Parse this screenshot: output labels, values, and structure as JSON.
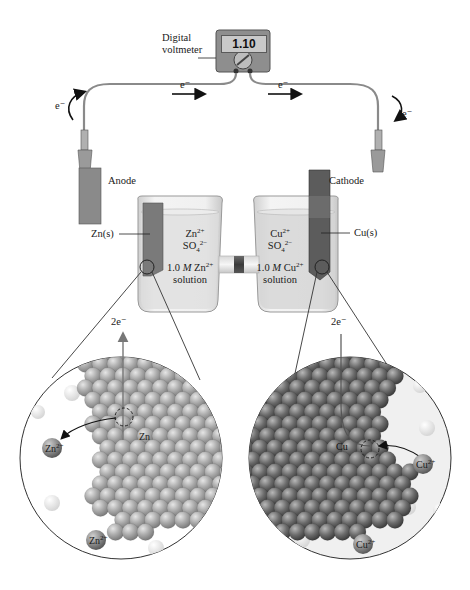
{
  "voltmeter": {
    "label_line1": "Digital",
    "label_line2": "voltmeter",
    "reading": "1.10"
  },
  "electron_labels": {
    "left_curve": "e⁻",
    "top_left": "e⁻",
    "top_right": "e⁻",
    "right_curve": "e⁻"
  },
  "anode": {
    "label": "Anode",
    "electrode_label": "Zn(s)",
    "ion1": "Zn",
    "ion1_charge": "2+",
    "ion2": "SO",
    "ion2_sub": "4",
    "ion2_charge": "2−",
    "conc_prefix": "1.0 ",
    "conc_unit": "M",
    "conc_ion": " Zn",
    "conc_charge": "2+",
    "solution": "solution"
  },
  "cathode": {
    "label": "Cathode",
    "electrode_label": "Cu(s)",
    "ion1": "Cu",
    "ion1_charge": "2+",
    "ion2": "SO",
    "ion2_sub": "4",
    "ion2_charge": "2−",
    "conc_prefix": "1.0 ",
    "conc_unit": "M",
    "conc_ion": " Cu",
    "conc_charge": "2+",
    "solution": "solution"
  },
  "zoom_left": {
    "electrons_out": "2e⁻",
    "metal_atom_label": "Zn",
    "ion_label_1": "Zn",
    "ion_label_1_charge": "2+",
    "ion_label_2": "Zn",
    "ion_label_2_charge": "2+"
  },
  "zoom_right": {
    "electrons_in": "2e⁻",
    "metal_atom_label": "Cu",
    "ion_label_1": "Cu",
    "ion_label_1_charge": "2+",
    "ion_label_2": "Cu",
    "ion_label_2_charge": "2+"
  },
  "colors": {
    "zinc_atom": "#a8a8a8",
    "copper_atom": "#6e6e6e",
    "electrode_zn": "#7a7a7a",
    "electrode_cu": "#5c5c5c",
    "beaker_glass": "#e8e8e8",
    "solution": "#dcdcdc"
  }
}
